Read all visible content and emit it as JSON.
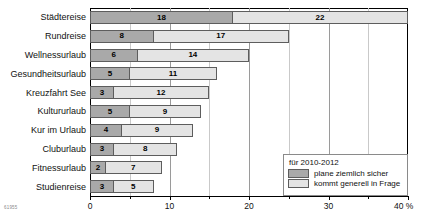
{
  "chart_data": {
    "type": "bar",
    "orientation": "horizontal",
    "stacked": true,
    "title": "",
    "xlabel": "40%",
    "ylabel": "",
    "xlim": [
      0,
      40
    ],
    "grid": true,
    "legend_position": "bottom-right",
    "categories": [
      "Städtereise",
      "Rundreise",
      "Wellnessurlaub",
      "Gesundheitsurlaub",
      "Kreuzfahrt See",
      "Kultururlaub",
      "Kur im Urlaub",
      "Cluburlaub",
      "Fitnessurlaub",
      "Studienreise"
    ],
    "series": [
      {
        "name": "plane ziemlich sicher",
        "color": "#a9a9a9",
        "values": [
          18,
          8,
          6,
          5,
          3,
          5,
          4,
          3,
          2,
          3
        ]
      },
      {
        "name": "kommt generell in Frage",
        "color": "#e4e4e4",
        "values": [
          22,
          17,
          14,
          11,
          12,
          9,
          9,
          8,
          7,
          5
        ]
      }
    ],
    "totals": [
      40,
      25,
      20,
      16,
      15,
      14,
      13,
      11,
      9,
      8
    ],
    "xticks": [
      0,
      5,
      10,
      15,
      20,
      25,
      30,
      35,
      40
    ],
    "xtick_labels": [
      "0",
      "",
      "10",
      "",
      "20",
      "",
      "30",
      "",
      "40 %"
    ],
    "xtick_major": [
      0,
      10,
      20,
      30,
      40
    ]
  },
  "legend": {
    "title": "für 2010-2012",
    "entries": [
      {
        "label": "plane ziemlich sicher",
        "swatch": "dark"
      },
      {
        "label": "kommt generell in Frage",
        "swatch": "light"
      }
    ]
  },
  "footer": {
    "source_id": "61955"
  }
}
